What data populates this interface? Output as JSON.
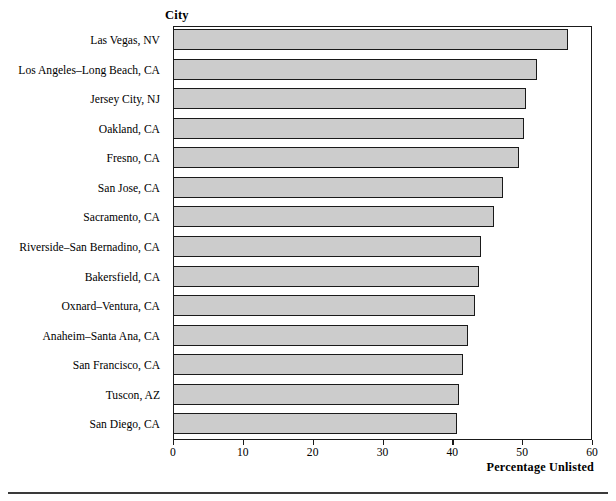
{
  "chart_data": {
    "type": "bar",
    "orientation": "horizontal",
    "title": "",
    "subtitle": "",
    "category_axis_title": "City",
    "xlabel": "Percentage Unlisted",
    "ylabel": "City",
    "xlim": [
      0,
      60
    ],
    "xticks": [
      0,
      10,
      20,
      30,
      40,
      50,
      60
    ],
    "xtick_labels": [
      "0",
      "10",
      "20",
      "30",
      "40",
      "50",
      "60"
    ],
    "grid": false,
    "legend": false,
    "bar_fill_color": "#cccccc",
    "bar_edge_color": "#1a1a1a",
    "categories": [
      "Las Vegas, NV",
      "Los Angeles–Long Beach, CA",
      "Jersey City, NJ",
      "Oakland, CA",
      "Fresno, CA",
      "San Jose, CA",
      "Sacramento, CA",
      "Riverside–San Bernadino, CA",
      "Bakersfield, CA",
      "Oxnard–Ventura, CA",
      "Anaheim–Santa Ana, CA",
      "San Francisco, CA",
      "Tuscon, AZ",
      "San Diego, CA"
    ],
    "values": [
      56.6,
      52.1,
      50.6,
      50.2,
      49.5,
      47.2,
      46.0,
      44.1,
      43.8,
      43.2,
      42.3,
      41.5,
      40.9,
      40.6
    ]
  }
}
